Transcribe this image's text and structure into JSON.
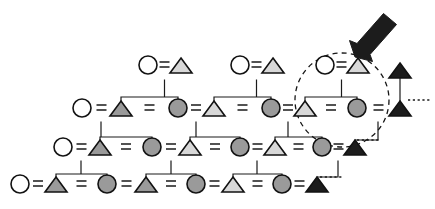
{
  "figure": {
    "name": "kinship-pedigree-diagram",
    "width": 435,
    "height": 209,
    "background_color": "#ffffff",
    "line_color": "#1a1a1a"
  },
  "legend_semantics": {
    "circle_open": "female-unshaded",
    "circle_shaded": "female-shaded",
    "triangle_light": "male-light-shaded",
    "triangle_medium": "male-medium-shaded",
    "triangle_dark": "male-dark-shaded",
    "equals_sign": "marriage-link",
    "dashed_circle": "highlighted-family-unit",
    "arrow": "annotation-pointer",
    "dashed_line": "continuation-ellipsis"
  },
  "fills": {
    "open": "#ffffff",
    "light": "#d8d8d8",
    "medium": "#9a9a9a",
    "dark": "#1c1c1c",
    "outline": "#121212"
  },
  "marriage_symbol": "=",
  "generations": [
    {
      "row": 1,
      "label": "generation-1",
      "y": 70,
      "couples": [
        {
          "wife": "circle_open",
          "husband": "triangle_light",
          "cx_wife": 148,
          "cx_husband": 181
        },
        {
          "wife": "circle_open",
          "husband": "triangle_light",
          "cx_wife": 240,
          "cx_husband": 273
        },
        {
          "wife": "circle_open",
          "husband": "triangle_light",
          "cx_wife": 325,
          "cx_husband": 358
        }
      ]
    },
    {
      "row": 2,
      "label": "generation-2",
      "y": 113,
      "nodes": [
        {
          "type": "circle_open",
          "cx": 82
        },
        {
          "type": "triangle_medium",
          "cx": 121
        },
        {
          "type": "circle_medium",
          "cx": 178
        },
        {
          "type": "triangle_light",
          "cx": 214
        },
        {
          "type": "circle_medium",
          "cx": 271
        },
        {
          "type": "triangle_light",
          "cx": 305
        },
        {
          "type": "circle_medium",
          "cx": 357
        },
        {
          "type": "triangle_dark",
          "cx": 400
        }
      ]
    },
    {
      "row": 3,
      "label": "generation-3",
      "y": 152,
      "nodes": [
        {
          "type": "circle_open",
          "cx": 63
        },
        {
          "type": "triangle_medium",
          "cx": 100
        },
        {
          "type": "circle_medium",
          "cx": 152
        },
        {
          "type": "triangle_light",
          "cx": 190
        },
        {
          "type": "circle_medium",
          "cx": 240
        },
        {
          "type": "triangle_light",
          "cx": 275
        },
        {
          "type": "circle_medium",
          "cx": 322
        },
        {
          "type": "triangle_dark",
          "cx": 355
        }
      ]
    },
    {
      "row": 4,
      "label": "generation-4",
      "y": 189,
      "nodes": [
        {
          "type": "circle_open",
          "cx": 20
        },
        {
          "type": "triangle_medium",
          "cx": 56
        },
        {
          "type": "circle_medium",
          "cx": 107
        },
        {
          "type": "triangle_medium",
          "cx": 146
        },
        {
          "type": "circle_medium",
          "cx": 196
        },
        {
          "type": "triangle_light",
          "cx": 233
        },
        {
          "type": "circle_medium",
          "cx": 282
        },
        {
          "type": "triangle_dark",
          "cx": 317
        }
      ]
    }
  ],
  "annotations": {
    "highlight": {
      "name": "highlighted-family-unit",
      "cx": 342,
      "cy": 100,
      "rx": 47,
      "ry": 47
    },
    "pointer": {
      "name": "annotation-arrow",
      "tip_x": 355,
      "tip_y": 55,
      "tail_x": 398,
      "tail_y": 13
    },
    "continuations": [
      {
        "name": "ellipsis-gen1-right",
        "x1": 408,
        "y1": 100,
        "x2": 432,
        "y2": 100
      },
      {
        "name": "ellipsis-gen3-right",
        "x1": 357,
        "y1": 140,
        "x2": 381,
        "y2": 140
      },
      {
        "name": "ellipsis-gen4-right",
        "x1": 320,
        "y1": 177,
        "x2": 344,
        "y2": 177
      }
    ]
  }
}
